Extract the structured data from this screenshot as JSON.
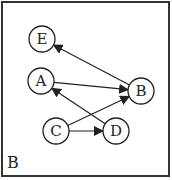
{
  "panel_label": "B",
  "graph": {
    "nodes": [
      {
        "id": "E",
        "label": "E",
        "x": 42,
        "y": 39
      },
      {
        "id": "A",
        "label": "A",
        "x": 41,
        "y": 81
      },
      {
        "id": "B",
        "label": "B",
        "x": 141,
        "y": 91
      },
      {
        "id": "C",
        "label": "C",
        "x": 56,
        "y": 131
      },
      {
        "id": "D",
        "label": "D",
        "x": 116,
        "y": 131
      }
    ],
    "edges": [
      {
        "from": "B",
        "to": "E"
      },
      {
        "from": "A",
        "to": "B"
      },
      {
        "from": "C",
        "to": "B"
      },
      {
        "from": "D",
        "to": "A"
      },
      {
        "from": "C",
        "to": "D"
      }
    ]
  },
  "colors": {
    "stroke": "#222222",
    "background": "#ffffff"
  }
}
